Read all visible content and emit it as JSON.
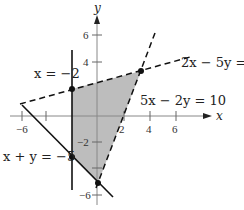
{
  "diagram": {
    "axes": {
      "x_label": "x",
      "y_label": "y",
      "x_ticks": [
        {
          "value": -6,
          "label": "−6"
        },
        {
          "value": 2,
          "label": "2"
        },
        {
          "value": 4,
          "label": "4"
        },
        {
          "value": 6,
          "label": "6"
        }
      ],
      "y_ticks": [
        {
          "value": 6,
          "label": "6"
        },
        {
          "value": 4,
          "label": "4"
        },
        {
          "value": -2,
          "label": "−2"
        },
        {
          "value": -6,
          "label": "−6"
        }
      ]
    },
    "lines": [
      {
        "equation": "x = −2",
        "style": "solid"
      },
      {
        "equation": "2x − 5y = −",
        "style": "dashed"
      },
      {
        "equation": "5x − 2y = 10",
        "style": "dashed"
      },
      {
        "equation": "x + y = −5",
        "style": "solid"
      }
    ],
    "vertices": [
      {
        "x": -2,
        "y": 2
      },
      {
        "x": 3.6,
        "y": 3.4
      },
      {
        "x": -2,
        "y": -3
      },
      {
        "x": 0,
        "y": -5
      }
    ],
    "region_fill": "#bdbdbd"
  }
}
